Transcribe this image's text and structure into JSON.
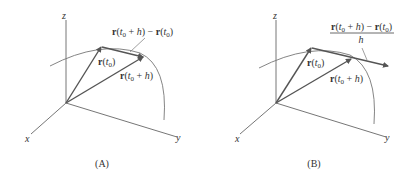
{
  "figures": [
    {
      "id": "A",
      "caption": "(A)",
      "axes": {
        "x": "x",
        "y": "y",
        "z": "z"
      },
      "vectors": [
        {
          "name": "r(t0)",
          "label": "r(t₀)"
        },
        {
          "name": "r(t0+h)",
          "label": "r(t₀ + h)"
        },
        {
          "name": "difference",
          "label": "r(t₀ + h) − r(t₀)"
        }
      ],
      "annotation": "r(t₀ + h) − r(t₀)"
    },
    {
      "id": "B",
      "caption": "(B)",
      "axes": {
        "x": "x",
        "y": "y",
        "z": "z"
      },
      "vectors": [
        {
          "name": "r(t0)",
          "label": "r(t₀)"
        },
        {
          "name": "r(t0+h)",
          "label": "r(t₀ + h)"
        },
        {
          "name": "difference-quotient",
          "label": "(r(t₀ + h) − r(t₀)) / h"
        }
      ],
      "annotation": {
        "numerator": "r(t₀ + h) − r(t₀)",
        "denominator": "h"
      }
    }
  ],
  "colors": {
    "axis": "#555555",
    "vector": "#555555",
    "curve": "#777777",
    "text": "#333333"
  }
}
